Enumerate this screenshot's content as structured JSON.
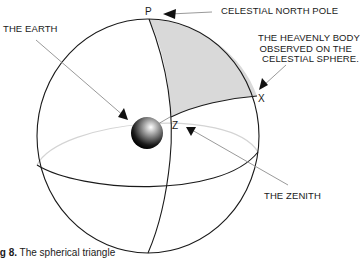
{
  "diagram": {
    "title": "The spherical triangle",
    "points": {
      "pole": "P",
      "zenith": "Z",
      "body": "X"
    },
    "labels": {
      "celestial_north_pole": "CELESTIAL NORTH POLE",
      "heavenly_body_line1": "THE HEAVENLY BODY",
      "heavenly_body_line2": "OBSERVED ON THE",
      "heavenly_body_line3": "CELESTIAL SPHERE.",
      "earth": "THE EARTH",
      "zenith": "THE ZENITH"
    },
    "caption": {
      "fig": "ig 8.",
      "text": " The spherical triangle"
    },
    "colors": {
      "outline": "#1a1a1a",
      "triangle_fill": "#d8d8d8",
      "pointer": "#9a9a9a",
      "back_equator": "#d0d0d0"
    }
  }
}
